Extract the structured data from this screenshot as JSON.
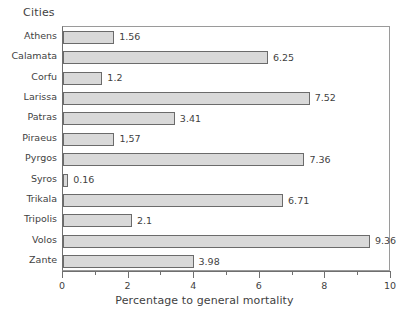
{
  "chart_data": {
    "type": "bar",
    "orientation": "horizontal",
    "title": "",
    "xlabel": "Percentage to general mortality",
    "ylabel": "Cities",
    "categories": [
      "Athens",
      "Calamata",
      "Corfu",
      "Larissa",
      "Patras",
      "Piraeus",
      "Pyrgos",
      "Syros",
      "Trikala",
      "Tripolis",
      "Volos",
      "Zante"
    ],
    "values": [
      1.56,
      6.25,
      1.2,
      7.52,
      3.41,
      1.57,
      7.36,
      0.16,
      6.71,
      2.1,
      9.36,
      3.98
    ],
    "data_labels": [
      "1.56",
      "6.25",
      "1.2",
      "7.52",
      "3.41",
      "1,57",
      "7.36",
      "0.16",
      "6.71",
      "2.1",
      "9.36",
      "3.98"
    ],
    "xlim": [
      0,
      10
    ],
    "xticks": [
      0,
      2,
      4,
      6,
      8,
      10
    ],
    "xtick_labels": [
      "0",
      "2",
      "4",
      "6",
      "8",
      "10"
    ],
    "xminor_ticks": [
      1,
      3,
      5,
      7,
      9
    ],
    "grid": false,
    "legend": false,
    "bar_fill_color": "#d9d9d9",
    "bar_border_color": "#6b6b6b",
    "axis_color": "#6f6f6f",
    "text_color": "#3f3f3f",
    "background_color": "#ffffff"
  }
}
